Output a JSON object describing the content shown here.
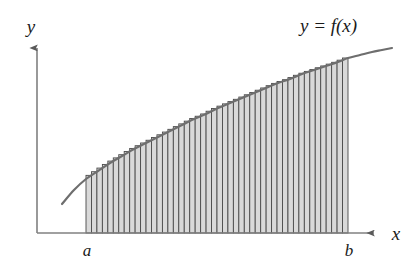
{
  "figure": {
    "background_color": "#ffffff",
    "labels": {
      "y_axis": "y",
      "x_axis": "x",
      "lower_bound": "a",
      "upper_bound": "b",
      "function": "y = f(x)",
      "function_parts": {
        "y": "y",
        "equals": "=",
        "f": "f",
        "open_paren": "(",
        "x": "x",
        "close_paren": ")"
      }
    },
    "colors": {
      "axis": "#808080",
      "curve": "#6e6e6e",
      "rect_fill": "#d9d9d9",
      "rect_stroke": "#4a4a4a",
      "text": "#1a1a1a"
    }
  },
  "chart_data": {
    "type": "area",
    "xlabel": "x",
    "ylabel": "y",
    "grid": false,
    "legend": null,
    "annotations": [
      {
        "text": "y = f(x)",
        "x": 348,
        "y": 30
      },
      {
        "text": "a",
        "x": 86,
        "y": 248
      },
      {
        "text": "b",
        "x": 348,
        "y": 248
      }
    ],
    "axis_ranges": {
      "x_pixels": [
        37,
        382
      ],
      "y_pixels": [
        233,
        42
      ]
    },
    "bounds": {
      "a": 86,
      "b": 348
    },
    "rect_count": 48,
    "rect_width": 5.46,
    "baseline_y": 233,
    "curve_extent_pixels": {
      "x_start": 62,
      "x_end": 392
    },
    "curve_points": [
      {
        "x": 62,
        "y": 204
      },
      {
        "x": 74,
        "y": 190
      },
      {
        "x": 86,
        "y": 179
      },
      {
        "x": 98,
        "y": 171
      },
      {
        "x": 110,
        "y": 163
      },
      {
        "x": 122,
        "y": 156
      },
      {
        "x": 134,
        "y": 149
      },
      {
        "x": 146,
        "y": 143
      },
      {
        "x": 158,
        "y": 137
      },
      {
        "x": 170,
        "y": 131
      },
      {
        "x": 182,
        "y": 125
      },
      {
        "x": 194,
        "y": 119
      },
      {
        "x": 206,
        "y": 114
      },
      {
        "x": 218,
        "y": 108
      },
      {
        "x": 230,
        "y": 103
      },
      {
        "x": 242,
        "y": 98
      },
      {
        "x": 254,
        "y": 93
      },
      {
        "x": 266,
        "y": 88
      },
      {
        "x": 278,
        "y": 83
      },
      {
        "x": 290,
        "y": 79
      },
      {
        "x": 302,
        "y": 74
      },
      {
        "x": 314,
        "y": 70
      },
      {
        "x": 326,
        "y": 66
      },
      {
        "x": 338,
        "y": 62
      },
      {
        "x": 348,
        "y": 58
      },
      {
        "x": 360,
        "y": 55
      },
      {
        "x": 372,
        "y": 52
      },
      {
        "x": 382,
        "y": 50
      },
      {
        "x": 392,
        "y": 48
      }
    ]
  }
}
